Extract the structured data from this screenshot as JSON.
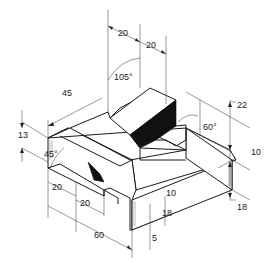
{
  "drawing": {
    "type": "isometric dimensioned part drawing",
    "dimensions": {
      "top_left_width": "20",
      "top_right_width": "20",
      "angle_top": "105°",
      "left_depth": "45",
      "left_height": "13",
      "chamfer_angle": "45°",
      "front_step_1": "20",
      "front_step_2": "20",
      "overall_length": "60",
      "right_angle": "60°",
      "right_height_upper": "22",
      "right_offset": "10",
      "right_height_lower": "18",
      "front_10": "10",
      "front_18": "18",
      "front_5": "5"
    },
    "colors": {
      "line": "#1a1a1a",
      "shade": "#111111",
      "background": "#ffffff"
    }
  }
}
